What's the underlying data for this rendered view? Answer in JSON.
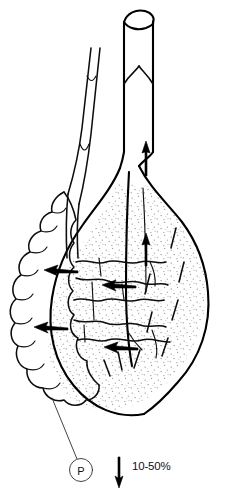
{
  "figure": {
    "background_color": "#ffffff",
    "ink_color": "#000000",
    "stipple_color": "#9a8f86",
    "width": 235,
    "height": 494
  },
  "labels": {
    "marker_p": "P",
    "legend_value": "10-50%"
  },
  "legend": {
    "arrow_direction": "down",
    "arrow_label": "10-50%"
  },
  "flow": {
    "upward_arrow_count": 2,
    "leftward_arrow_count": 4,
    "upward_meaning": "antegrade flow",
    "leftward_meaning": "retrograde reflux"
  },
  "parts": {
    "outflow_tube": "cut-open cylindrical duct with rim ellipse",
    "valve": "sphincter valve cusps",
    "ureter": "slender twin-line duct with valve notches",
    "lobulated_organ": "scalloped lobulated gland",
    "main_body": "stippled pear-shaped reservoir",
    "fissures": "interdigitating cleft boundaries"
  }
}
